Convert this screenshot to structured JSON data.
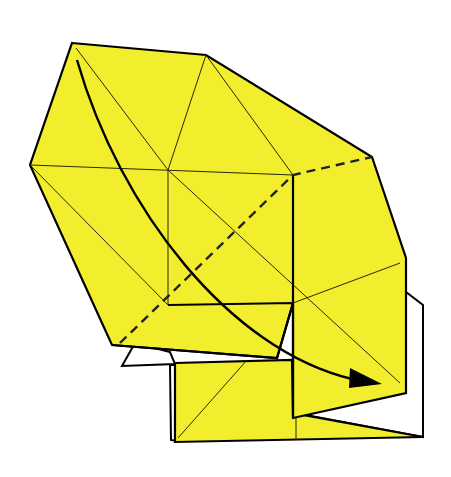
{
  "diagram": {
    "type": "origami-fold-step",
    "colors": {
      "paper_front": "#f2ee2e",
      "paper_back": "#ffffff",
      "lines": "#000000"
    },
    "symbols": {
      "fold_arrow": "curved-arrow-with-filled-head",
      "valley_fold": "dashed-line"
    }
  }
}
